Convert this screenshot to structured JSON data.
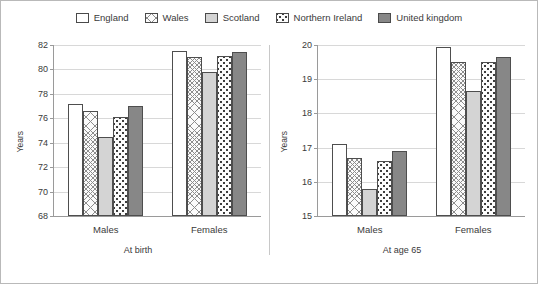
{
  "legend": {
    "position": "top-center",
    "items": [
      {
        "label": "England",
        "pattern": "solid-white",
        "color": "#ffffff"
      },
      {
        "label": "Wales",
        "pattern": "cross-hatch",
        "color": "#fbfbfb"
      },
      {
        "label": "Scotland",
        "pattern": "light-grey",
        "color": "#d4d4d4"
      },
      {
        "label": "Northern Ireland",
        "pattern": "dotted",
        "color": "#fcfcfc"
      },
      {
        "label": "United kingdom",
        "pattern": "dark-grey",
        "color": "#878787"
      }
    ]
  },
  "chart_data": [
    {
      "type": "bar",
      "title": "At birth",
      "xlabel": "",
      "ylabel": "Years",
      "categories": [
        "Males",
        "Females"
      ],
      "ylim": [
        68,
        82
      ],
      "yticks": [
        68,
        70,
        72,
        74,
        76,
        78,
        80,
        82
      ],
      "grid": true,
      "series": [
        {
          "name": "England",
          "values": [
            77.2,
            81.5
          ]
        },
        {
          "name": "Wales",
          "values": [
            76.6,
            81.0
          ]
        },
        {
          "name": "Scotland",
          "values": [
            74.5,
            79.8
          ]
        },
        {
          "name": "Northern Ireland",
          "values": [
            76.1,
            81.1
          ]
        },
        {
          "name": "United kingdom",
          "values": [
            77.0,
            81.4
          ]
        }
      ]
    },
    {
      "type": "bar",
      "title": "At age 65",
      "xlabel": "",
      "ylabel": "Years",
      "categories": [
        "Males",
        "Females"
      ],
      "ylim": [
        15,
        20
      ],
      "yticks": [
        15,
        16,
        17,
        18,
        19,
        20
      ],
      "grid": true,
      "series": [
        {
          "name": "England",
          "values": [
            17.1,
            19.95
          ]
        },
        {
          "name": "Wales",
          "values": [
            16.7,
            19.5
          ]
        },
        {
          "name": "Scotland",
          "values": [
            15.8,
            18.65
          ]
        },
        {
          "name": "Northern Ireland",
          "values": [
            16.6,
            19.5
          ]
        },
        {
          "name": "United kingdom",
          "values": [
            16.9,
            19.65
          ]
        }
      ]
    }
  ]
}
